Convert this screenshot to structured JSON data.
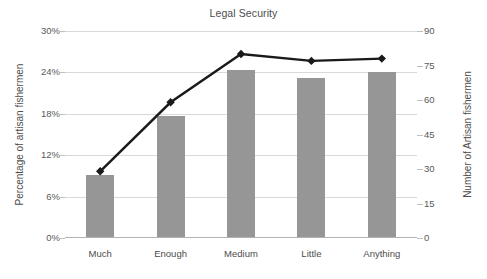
{
  "chart_data": {
    "type": "bar",
    "title": "Legal Security",
    "xlabel": "",
    "ylabel": "Percentage of artisan fishermen",
    "y2label": "Number of Artisan fishermen",
    "categories": [
      "Much",
      "Enough",
      "Medium",
      "Little",
      "Anything"
    ],
    "grid": true,
    "legend": "none",
    "ylim": [
      0,
      30
    ],
    "y2lim": [
      0,
      90
    ],
    "yticks": [
      "0%",
      "6%",
      "12%",
      "18%",
      "24%",
      "30%"
    ],
    "ytick_values": [
      0,
      6,
      12,
      18,
      24,
      30
    ],
    "y2ticks": [
      "0",
      "15",
      "30",
      "45",
      "60",
      "75",
      "90"
    ],
    "y2tick_values": [
      0,
      15,
      30,
      45,
      60,
      75,
      90
    ],
    "series": [
      {
        "name": "Percentage of artisan fishermen",
        "type": "bar",
        "axis": "left",
        "color": "#969696",
        "values": [
          9.2,
          17.7,
          24.3,
          23.2,
          24.0
        ]
      },
      {
        "name": "Number of Artisan fishermen",
        "type": "line",
        "axis": "right",
        "color": "#1a1a1a",
        "marker": "diamond",
        "values": [
          29,
          59,
          80,
          77,
          78
        ]
      }
    ]
  },
  "colors": {
    "bar": "#969696",
    "line": "#1a1a1a",
    "grid": "#d9d9d9",
    "axis": "#b3b3b3",
    "text": "#4c4c4c",
    "background": "#ffffff"
  }
}
